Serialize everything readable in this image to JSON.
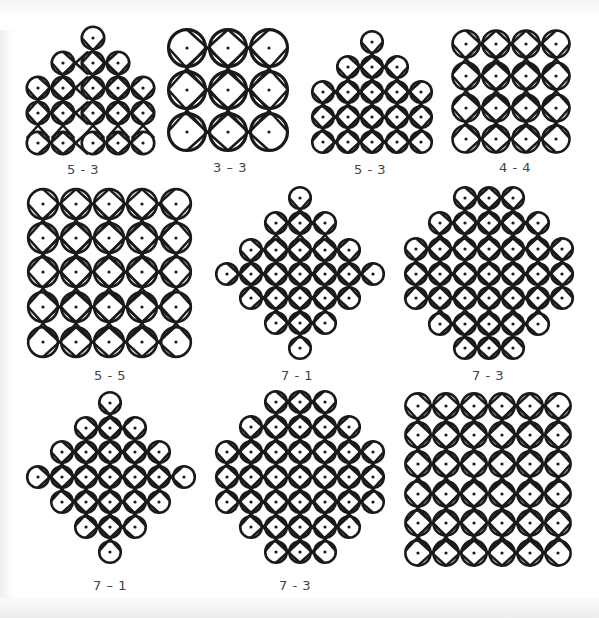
{
  "figure": {
    "stroke_color": "#1a1a1a",
    "dot_color": "#1a1a1a",
    "background": "#ffffff"
  },
  "patterns": [
    {
      "label": "5 - 3",
      "label_x": 83,
      "label_y": 162,
      "spacing": 25,
      "dots": [
        [
          93,
          38
        ],
        [
          63,
          63
        ],
        [
          93,
          63
        ],
        [
          118,
          63
        ],
        [
          38,
          88
        ],
        [
          63,
          88
        ],
        [
          93,
          88
        ],
        [
          118,
          88
        ],
        [
          143,
          88
        ],
        [
          38,
          113
        ],
        [
          63,
          113
        ],
        [
          93,
          113
        ],
        [
          118,
          113
        ],
        [
          143,
          113
        ],
        [
          38,
          143
        ],
        [
          63,
          143
        ],
        [
          93,
          143
        ],
        [
          118,
          143
        ],
        [
          143,
          143
        ]
      ]
    },
    {
      "label": "3 – 3",
      "label_x": 230,
      "label_y": 160,
      "spacing": 41,
      "dots": [
        [
          187,
          48
        ],
        [
          228,
          48
        ],
        [
          269,
          48
        ],
        [
          187,
          90
        ],
        [
          228,
          90
        ],
        [
          269,
          90
        ],
        [
          187,
          132
        ],
        [
          228,
          132
        ],
        [
          269,
          132
        ]
      ]
    },
    {
      "label": "5 - 3",
      "label_x": 370,
      "label_y": 162,
      "spacing": 24,
      "dots": [
        [
          372,
          42
        ],
        [
          348,
          67
        ],
        [
          372,
          67
        ],
        [
          397,
          67
        ],
        [
          323,
          92
        ],
        [
          348,
          92
        ],
        [
          372,
          92
        ],
        [
          397,
          92
        ],
        [
          421,
          92
        ],
        [
          323,
          117
        ],
        [
          348,
          117
        ],
        [
          372,
          117
        ],
        [
          397,
          117
        ],
        [
          421,
          117
        ],
        [
          323,
          142
        ],
        [
          348,
          142
        ],
        [
          372,
          142
        ],
        [
          397,
          142
        ],
        [
          421,
          142
        ]
      ]
    },
    {
      "label": "4 - 4",
      "label_x": 515,
      "label_y": 160,
      "spacing": 30,
      "dots": [
        [
          466,
          44
        ],
        [
          496,
          44
        ],
        [
          526,
          44
        ],
        [
          556,
          44
        ],
        [
          466,
          76
        ],
        [
          496,
          76
        ],
        [
          526,
          76
        ],
        [
          556,
          76
        ],
        [
          466,
          108
        ],
        [
          496,
          108
        ],
        [
          526,
          108
        ],
        [
          556,
          108
        ],
        [
          466,
          139
        ],
        [
          496,
          139
        ],
        [
          526,
          139
        ],
        [
          556,
          139
        ]
      ]
    },
    {
      "label": "5 - 5",
      "label_x": 110,
      "label_y": 368,
      "spacing": 33,
      "dots": [
        [
          43,
          204
        ],
        [
          76,
          204
        ],
        [
          109,
          204
        ],
        [
          142,
          204
        ],
        [
          176,
          204
        ],
        [
          43,
          238
        ],
        [
          76,
          238
        ],
        [
          109,
          238
        ],
        [
          142,
          238
        ],
        [
          176,
          238
        ],
        [
          43,
          272
        ],
        [
          76,
          272
        ],
        [
          109,
          272
        ],
        [
          142,
          272
        ],
        [
          176,
          272
        ],
        [
          43,
          307
        ],
        [
          76,
          307
        ],
        [
          109,
          307
        ],
        [
          142,
          307
        ],
        [
          176,
          307
        ],
        [
          43,
          342
        ],
        [
          76,
          342
        ],
        [
          109,
          342
        ],
        [
          142,
          342
        ],
        [
          176,
          342
        ]
      ]
    },
    {
      "label": "7 - 1",
      "label_x": 297,
      "label_y": 368,
      "spacing": 24,
      "dots": [
        [
          300,
          198
        ],
        [
          276,
          223
        ],
        [
          300,
          223
        ],
        [
          325,
          223
        ],
        [
          251,
          250
        ],
        [
          276,
          250
        ],
        [
          300,
          250
        ],
        [
          325,
          250
        ],
        [
          349,
          250
        ],
        [
          227,
          274
        ],
        [
          251,
          274
        ],
        [
          276,
          274
        ],
        [
          300,
          274
        ],
        [
          325,
          274
        ],
        [
          349,
          274
        ],
        [
          373,
          274
        ],
        [
          251,
          298
        ],
        [
          276,
          298
        ],
        [
          300,
          298
        ],
        [
          325,
          298
        ],
        [
          349,
          298
        ],
        [
          276,
          323
        ],
        [
          300,
          323
        ],
        [
          325,
          323
        ],
        [
          300,
          348
        ]
      ]
    },
    {
      "label": "7 - 3",
      "label_x": 488,
      "label_y": 368,
      "spacing": 24,
      "dots": [
        [
          465,
          198
        ],
        [
          489,
          198
        ],
        [
          513,
          198
        ],
        [
          440,
          223
        ],
        [
          465,
          223
        ],
        [
          489,
          223
        ],
        [
          513,
          223
        ],
        [
          538,
          223
        ],
        [
          416,
          249
        ],
        [
          440,
          249
        ],
        [
          465,
          249
        ],
        [
          489,
          249
        ],
        [
          513,
          249
        ],
        [
          538,
          249
        ],
        [
          562,
          249
        ],
        [
          416,
          274
        ],
        [
          440,
          274
        ],
        [
          465,
          274
        ],
        [
          489,
          274
        ],
        [
          513,
          274
        ],
        [
          538,
          274
        ],
        [
          562,
          274
        ],
        [
          416,
          298
        ],
        [
          440,
          298
        ],
        [
          465,
          298
        ],
        [
          489,
          298
        ],
        [
          513,
          298
        ],
        [
          538,
          298
        ],
        [
          562,
          298
        ],
        [
          440,
          324
        ],
        [
          465,
          324
        ],
        [
          489,
          324
        ],
        [
          513,
          324
        ],
        [
          538,
          324
        ],
        [
          465,
          348
        ],
        [
          489,
          348
        ],
        [
          513,
          348
        ]
      ]
    },
    {
      "label": "7 – 1",
      "label_x": 110,
      "label_y": 578,
      "spacing": 24,
      "dots": [
        [
          110,
          403
        ],
        [
          86,
          428
        ],
        [
          110,
          428
        ],
        [
          135,
          428
        ],
        [
          62,
          452
        ],
        [
          86,
          452
        ],
        [
          110,
          452
        ],
        [
          135,
          452
        ],
        [
          159,
          452
        ],
        [
          38,
          477
        ],
        [
          62,
          477
        ],
        [
          86,
          477
        ],
        [
          110,
          477
        ],
        [
          135,
          477
        ],
        [
          159,
          477
        ],
        [
          184,
          477
        ],
        [
          62,
          502
        ],
        [
          86,
          502
        ],
        [
          110,
          502
        ],
        [
          135,
          502
        ],
        [
          159,
          502
        ],
        [
          86,
          527
        ],
        [
          110,
          527
        ],
        [
          135,
          527
        ],
        [
          110,
          552
        ]
      ]
    },
    {
      "label": "7 - 3",
      "label_x": 295,
      "label_y": 578,
      "spacing": 24,
      "dots": [
        [
          276,
          402
        ],
        [
          300,
          402
        ],
        [
          325,
          402
        ],
        [
          251,
          427
        ],
        [
          276,
          427
        ],
        [
          300,
          427
        ],
        [
          325,
          427
        ],
        [
          349,
          427
        ],
        [
          227,
          452
        ],
        [
          251,
          452
        ],
        [
          276,
          452
        ],
        [
          300,
          452
        ],
        [
          325,
          452
        ],
        [
          349,
          452
        ],
        [
          373,
          452
        ],
        [
          227,
          477
        ],
        [
          251,
          477
        ],
        [
          276,
          477
        ],
        [
          300,
          477
        ],
        [
          325,
          477
        ],
        [
          349,
          477
        ],
        [
          373,
          477
        ],
        [
          227,
          502
        ],
        [
          251,
          502
        ],
        [
          276,
          502
        ],
        [
          300,
          502
        ],
        [
          325,
          502
        ],
        [
          349,
          502
        ],
        [
          373,
          502
        ],
        [
          251,
          527
        ],
        [
          276,
          527
        ],
        [
          300,
          527
        ],
        [
          325,
          527
        ],
        [
          349,
          527
        ],
        [
          276,
          552
        ],
        [
          300,
          552
        ],
        [
          325,
          552
        ]
      ]
    },
    {
      "label": "6 - 6",
      "label_x": 488,
      "label_y": 578,
      "spacing": 28,
      "dots": [
        [
          418,
          406
        ],
        [
          446,
          406
        ],
        [
          474,
          406
        ],
        [
          502,
          406
        ],
        [
          530,
          406
        ],
        [
          558,
          406
        ],
        [
          418,
          435
        ],
        [
          446,
          435
        ],
        [
          474,
          435
        ],
        [
          502,
          435
        ],
        [
          530,
          435
        ],
        [
          558,
          435
        ],
        [
          418,
          464
        ],
        [
          446,
          464
        ],
        [
          474,
          464
        ],
        [
          502,
          464
        ],
        [
          530,
          464
        ],
        [
          558,
          464
        ],
        [
          418,
          494
        ],
        [
          446,
          494
        ],
        [
          474,
          494
        ],
        [
          502,
          494
        ],
        [
          530,
          494
        ],
        [
          558,
          494
        ],
        [
          418,
          523
        ],
        [
          446,
          523
        ],
        [
          474,
          523
        ],
        [
          502,
          523
        ],
        [
          530,
          523
        ],
        [
          558,
          523
        ],
        [
          418,
          553
        ],
        [
          446,
          553
        ],
        [
          474,
          553
        ],
        [
          502,
          553
        ],
        [
          530,
          553
        ],
        [
          558,
          553
        ]
      ]
    }
  ]
}
